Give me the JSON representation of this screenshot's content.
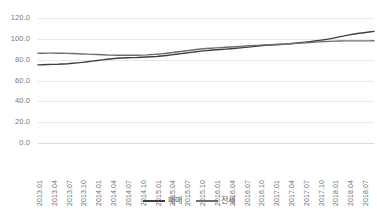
{
  "chart_data": {
    "type": "line",
    "title": "",
    "subtitle": "",
    "xlabel": "",
    "ylabel": "",
    "ylim": [
      0.0,
      120.0
    ],
    "y_ticks": [
      "0.0",
      "20.0",
      "40.0",
      "60.0",
      "80.0",
      "100.0",
      "120.0"
    ],
    "y_tick_values": [
      0.0,
      20.0,
      40.0,
      60.0,
      80.0,
      100.0,
      120.0
    ],
    "grid": true,
    "grid_axis": "y",
    "legend_position": "bottom-center",
    "x_tick_labels": [
      "2013.01",
      "2013.04",
      "2013.07",
      "2013.10",
      "2014.01",
      "2014.04",
      "2014.07",
      "2014.10",
      "2015.01",
      "2015.04",
      "2015.07",
      "2015.10",
      "2016.01",
      "2016.04",
      "2016.07",
      "2016.10",
      "2017.01",
      "2017.04",
      "2017.07",
      "2017.10",
      "2018.01",
      "2018.04",
      "2018.07"
    ],
    "x": [
      "2013.01",
      "2013.02",
      "2013.03",
      "2013.04",
      "2013.05",
      "2013.06",
      "2013.07",
      "2013.08",
      "2013.09",
      "2013.10",
      "2013.11",
      "2013.12",
      "2014.01",
      "2014.02",
      "2014.03",
      "2014.04",
      "2014.05",
      "2014.06",
      "2014.07",
      "2014.08",
      "2014.09",
      "2014.10",
      "2014.11",
      "2014.12",
      "2015.01",
      "2015.02",
      "2015.03",
      "2015.04",
      "2015.05",
      "2015.06",
      "2015.07",
      "2015.08",
      "2015.09",
      "2015.10",
      "2015.11",
      "2015.12",
      "2016.01",
      "2016.02",
      "2016.03",
      "2016.04",
      "2016.05",
      "2016.06",
      "2016.07",
      "2016.08",
      "2016.09",
      "2016.10",
      "2016.11",
      "2016.12",
      "2017.01",
      "2017.02",
      "2017.03",
      "2017.04",
      "2017.05",
      "2017.06",
      "2017.07",
      "2017.08",
      "2017.09",
      "2017.10",
      "2017.11",
      "2017.12",
      "2018.01",
      "2018.02",
      "2018.03",
      "2018.04",
      "2018.05",
      "2018.06",
      "2018.07",
      "2018.08",
      "2018.09"
    ],
    "series": [
      {
        "name": "매매",
        "color": "#404040",
        "values": [
          75.0,
          75.1,
          75.3,
          75.5,
          75.6,
          75.8,
          76.1,
          76.5,
          76.9,
          77.4,
          78.0,
          78.6,
          79.2,
          79.8,
          80.4,
          80.9,
          81.3,
          81.6,
          81.8,
          82.0,
          82.1,
          82.3,
          82.5,
          82.8,
          83.1,
          83.5,
          84.0,
          84.6,
          85.2,
          85.8,
          86.4,
          87.0,
          87.6,
          88.2,
          88.7,
          89.1,
          89.5,
          89.8,
          90.1,
          90.5,
          90.9,
          91.3,
          91.8,
          92.3,
          92.8,
          93.3,
          93.7,
          94.0,
          94.3,
          94.6,
          94.9,
          95.3,
          95.7,
          96.2,
          96.7,
          97.3,
          97.9,
          98.5,
          99.2,
          100.0,
          100.9,
          101.9,
          102.9,
          103.8,
          104.6,
          105.3,
          105.9,
          106.5,
          107.2
        ]
      },
      {
        "name": "전세",
        "color": "#6e6e6e",
        "values": [
          86.2,
          86.2,
          86.3,
          86.3,
          86.2,
          86.1,
          86.0,
          85.9,
          85.7,
          85.5,
          85.3,
          85.1,
          84.9,
          84.7,
          84.5,
          84.4,
          84.3,
          84.2,
          84.2,
          84.2,
          84.3,
          84.4,
          84.6,
          84.9,
          85.2,
          85.6,
          86.1,
          86.7,
          87.3,
          87.9,
          88.5,
          89.1,
          89.7,
          90.2,
          90.7,
          91.0,
          91.3,
          91.6,
          91.9,
          92.2,
          92.5,
          92.8,
          93.1,
          93.4,
          93.7,
          94.0,
          94.2,
          94.4,
          94.6,
          94.8,
          95.0,
          95.3,
          95.6,
          95.9,
          96.2,
          96.5,
          96.8,
          97.1,
          97.4,
          97.6,
          97.8,
          97.9,
          98.0,
          98.0,
          98.0,
          98.0,
          98.0,
          98.0,
          98.1
        ]
      }
    ]
  },
  "legend": {
    "items": [
      {
        "label": "매매"
      },
      {
        "label": "전세"
      }
    ]
  }
}
